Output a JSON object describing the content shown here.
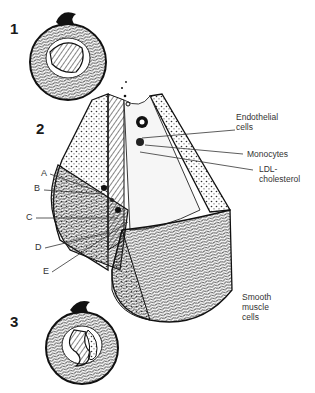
{
  "stages": [
    {
      "number": "1",
      "description": "Cross-section of healthy artery"
    },
    {
      "number": "2",
      "description": "Cutaway of artery wall showing plaque formation"
    },
    {
      "number": "3",
      "description": "Cross-section of artery narrowed by plaque"
    }
  ],
  "labels": {
    "endothelial_line1": "Endothelial",
    "endothelial_line2": "cells",
    "monocytes": "Monocytes",
    "ldl_line1": "LDL-",
    "ldl_line2": "cholesterol",
    "smooth_line1": "Smooth",
    "smooth_line2": "muscle",
    "smooth_line3": "cells"
  },
  "letters": [
    "A",
    "B",
    "C",
    "D",
    "E"
  ],
  "colors": {
    "ink": "#1a1a1a",
    "background": "#ffffff",
    "label": "#333333"
  }
}
